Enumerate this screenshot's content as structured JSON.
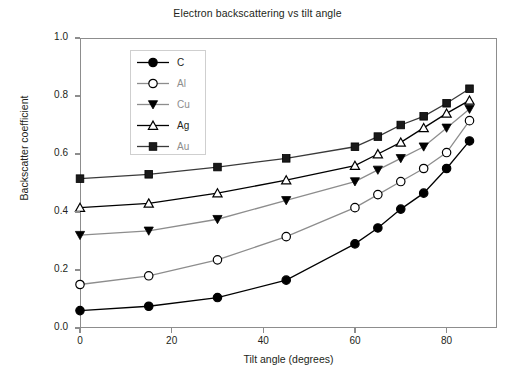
{
  "chart_data": {
    "type": "line",
    "title": "Electron backscattering vs tilt angle",
    "xlabel": "Tilt angle (degrees)",
    "ylabel": "Backscatter coefficient",
    "xlim": [
      0,
      91
    ],
    "ylim": [
      0.0,
      1.0
    ],
    "grid": false,
    "legend_position": "upper-left-inside",
    "xticks": [
      0,
      20,
      40,
      60,
      80
    ],
    "xtick_labels": [
      "0",
      "20",
      "40",
      "60",
      "80"
    ],
    "yticks": [
      0.0,
      0.2,
      0.4,
      0.6,
      0.8,
      1.0
    ],
    "ytick_labels": [
      "0.0",
      "0.2",
      "0.4",
      "0.6",
      "0.8",
      "1.0"
    ],
    "x": [
      0,
      15,
      30,
      45,
      60,
      65,
      70,
      75,
      80,
      85
    ],
    "series": [
      {
        "name": "C",
        "marker": "filled-circle",
        "color": "#000000",
        "values": [
          0.06,
          0.075,
          0.105,
          0.165,
          0.29,
          0.345,
          0.41,
          0.465,
          0.55,
          0.645
        ]
      },
      {
        "name": "Al",
        "marker": "open-circle",
        "color": "#8d8d8d",
        "values": [
          0.15,
          0.18,
          0.235,
          0.315,
          0.415,
          0.46,
          0.505,
          0.55,
          0.605,
          0.715
        ]
      },
      {
        "name": "Cu",
        "marker": "filled-triangle-down",
        "color": "#8d8d8d",
        "values": [
          0.32,
          0.335,
          0.375,
          0.44,
          0.505,
          0.545,
          0.585,
          0.625,
          0.69,
          0.755
        ]
      },
      {
        "name": "Ag",
        "marker": "open-triangle-up",
        "color": "#000000",
        "values": [
          0.415,
          0.43,
          0.465,
          0.51,
          0.56,
          0.6,
          0.64,
          0.69,
          0.74,
          0.785
        ]
      },
      {
        "name": "Au",
        "marker": "filled-square",
        "color": "#3a3a3a",
        "values": [
          0.515,
          0.53,
          0.555,
          0.585,
          0.625,
          0.66,
          0.7,
          0.73,
          0.775,
          0.825
        ]
      }
    ]
  },
  "colors": {
    "axis": "#8d8d8d",
    "text": "#231f20",
    "legend_border": "#cfcfcf",
    "background": "#ffffff"
  }
}
